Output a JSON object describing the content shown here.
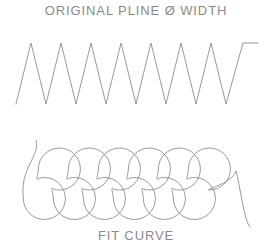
{
  "figure": {
    "captions": {
      "top": "ORIGINAL  PLINE Ø WIDTH",
      "bottom": "FIT CURVE"
    },
    "stroke_color": "#8d8d8d",
    "background_color": "#ffffff",
    "text_color": "#8a8a8a",
    "canvas": {
      "width": 272,
      "height": 247
    },
    "shapes": [
      {
        "name": "original-polyline-zigzag",
        "type": "polyline",
        "description": "Sharp-cornered zigzag polyline with 8 peaks",
        "peak_count": 8,
        "valley_count": 8,
        "peak_y": 43,
        "valley_y": 104,
        "start_x": 16,
        "end_x": 258,
        "period": 30,
        "points": [
          [
            16,
            104
          ],
          [
            31,
            43
          ],
          [
            46,
            104
          ],
          [
            61,
            43
          ],
          [
            76,
            104
          ],
          [
            91,
            43
          ],
          [
            106,
            104
          ],
          [
            121,
            43
          ],
          [
            136,
            104
          ],
          [
            151,
            43
          ],
          [
            166,
            104
          ],
          [
            181,
            43
          ],
          [
            196,
            104
          ],
          [
            211,
            43
          ],
          [
            226,
            104
          ],
          [
            243,
            43
          ],
          [
            258,
            43
          ]
        ]
      },
      {
        "name": "fit-curve-loops",
        "type": "spline",
        "description": "Smoothed spline fit of the zigzag producing overlapping loops",
        "upper_loop_count": 6,
        "lower_loop_count": 6,
        "upper_loop_top_y": 148,
        "upper_loop_bottom_y": 190,
        "lower_loop_top_y": 178,
        "lower_loop_bottom_y": 219,
        "loop_period": 30,
        "loop_radius": 21,
        "lead_in_start": [
          36,
          140
        ],
        "lead_out_end": [
          250,
          227
        ]
      }
    ]
  }
}
